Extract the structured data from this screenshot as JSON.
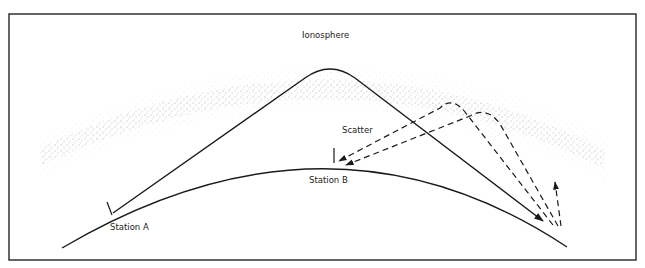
{
  "diagram": {
    "labels": {
      "ionosphere": "Ionosphere",
      "scatter": "Scatter",
      "station_a": "Station A",
      "station_b": "Station B"
    },
    "elements": {
      "frame": "rectangular border",
      "earth_surface": "curved arc representing Earth's surface",
      "ionosphere_layer": "stippled curved band",
      "primary_path": "solid line from Station A reflecting off ionosphere, arriving beyond Station B",
      "scatter_paths": "dashed lines scattered back from ionosphere toward Station B",
      "upward_scatter": "dashed arrow pointing upward near far end"
    },
    "colors": {
      "line": "#1a1a1a",
      "stipple": "#555555",
      "background": "#ffffff",
      "frame": "#333333"
    }
  }
}
